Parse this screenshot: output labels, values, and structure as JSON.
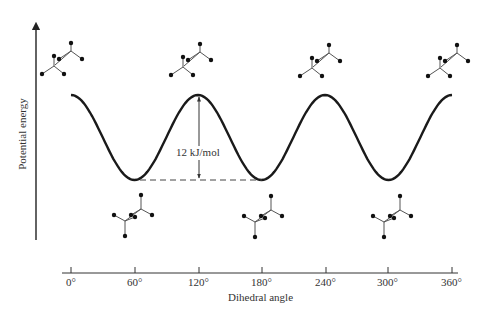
{
  "chart_data": {
    "type": "line",
    "title": "",
    "xlabel": "Dihedral angle",
    "ylabel": "Potential energy",
    "x_ticks": [
      "0°",
      "60°",
      "120°",
      "180°",
      "240°",
      "300°",
      "360°"
    ],
    "x": [
      0,
      60,
      120,
      180,
      240,
      300,
      360
    ],
    "series": [
      {
        "name": "Potential energy (relative, kJ/mol)",
        "values": [
          12,
          0,
          12,
          0,
          12,
          0,
          12
        ]
      }
    ],
    "xlim": [
      0,
      360
    ],
    "grid": false,
    "legend": "none",
    "annotations": [
      {
        "text": "12 kJ/mol",
        "type": "double-arrow",
        "from_x": 120,
        "description": "energy barrier between eclipsed maximum and staggered minimum"
      },
      {
        "type": "dashed-line",
        "from_x": 60,
        "to_x": 180,
        "description": "baseline at minimum energy"
      }
    ],
    "conformers": {
      "eclipsed_top": [
        0,
        120,
        240,
        360
      ],
      "staggered_bottom": [
        60,
        180,
        300
      ]
    }
  },
  "labels": {
    "y_axis": "Potential energy",
    "x_axis": "Dihedral angle",
    "barrier": "12 kJ/mol",
    "ticks": [
      "0°",
      "60°",
      "120°",
      "180°",
      "240°",
      "300°",
      "360°"
    ]
  }
}
